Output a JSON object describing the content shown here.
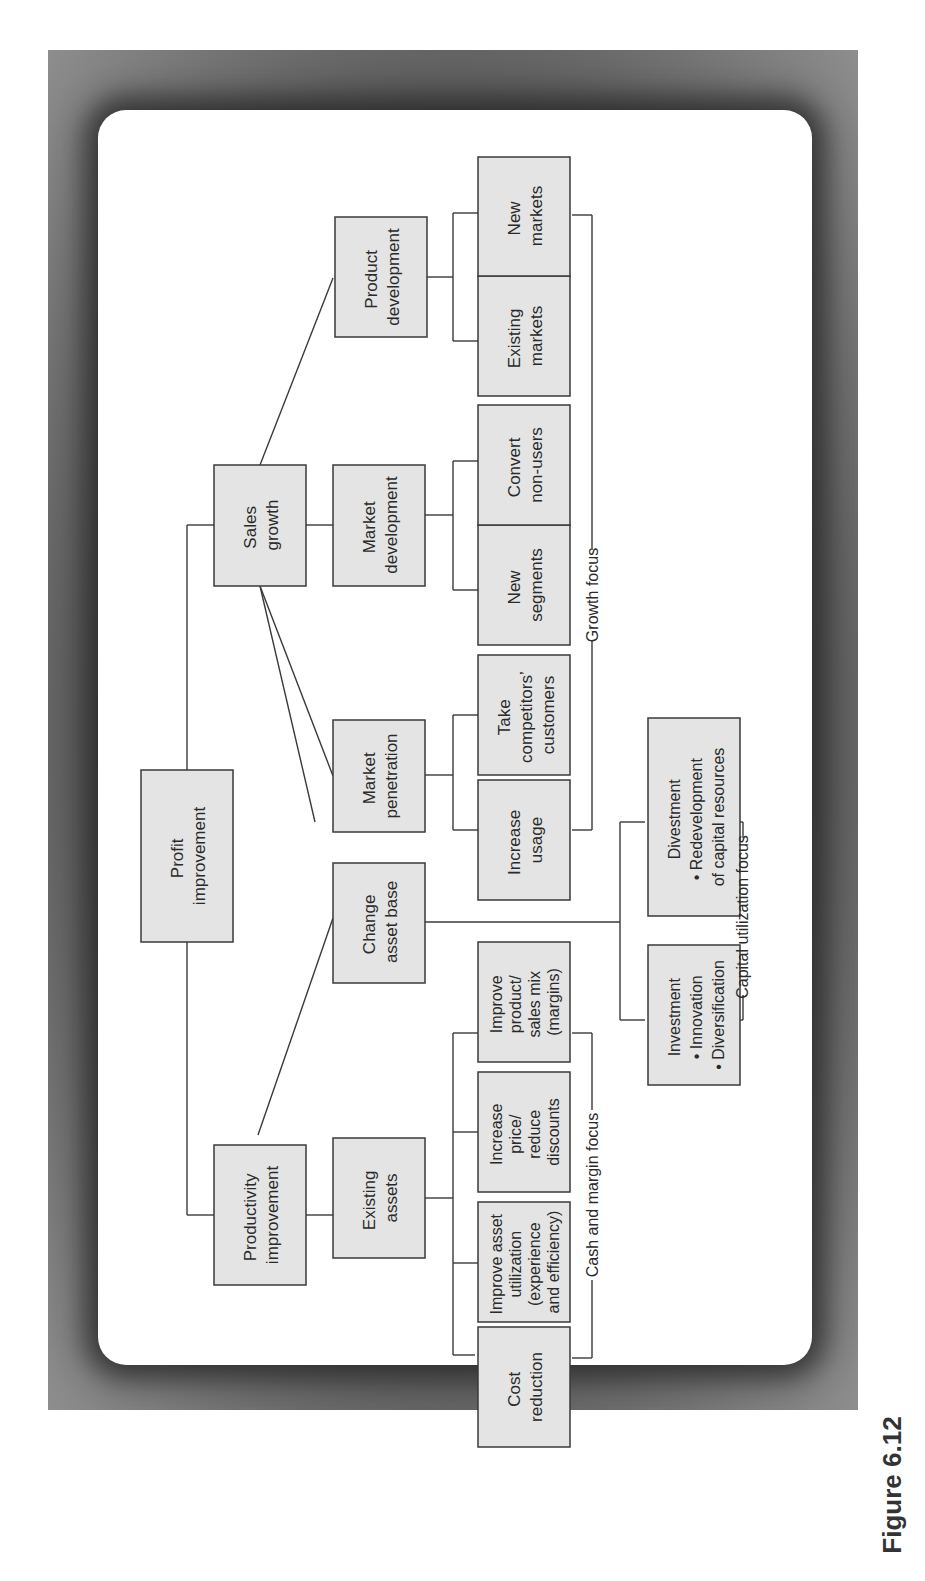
{
  "figure": {
    "caption": "Figure 6.12",
    "orientation": "rotated-90-ccw"
  },
  "colors": {
    "box_fill": "#e4e4e4",
    "box_stroke": "#3a3a3a",
    "frame": "#8a8a8a",
    "panel": "#ffffff"
  },
  "nodes": {
    "root": [
      "Profit",
      "improvement"
    ],
    "productivity": [
      "Productivity",
      "improvement"
    ],
    "sales_growth": [
      "Sales",
      "growth"
    ],
    "existing_assets": [
      "Existing",
      "assets"
    ],
    "change_asset_base": [
      "Change",
      "asset base"
    ],
    "market_penetration": [
      "Market",
      "penetration"
    ],
    "market_development": [
      "Market",
      "development"
    ],
    "product_development": [
      "Product",
      "development"
    ],
    "cost_reduction": [
      "Cost",
      "reduction"
    ],
    "improve_asset_utilization": [
      "Improve asset",
      "utilization",
      "(experience",
      "and efficiency)"
    ],
    "increase_price": [
      "Increase",
      "price/",
      "reduce",
      "discounts"
    ],
    "improve_product_mix": [
      "Improve",
      "product/",
      "sales mix",
      "(margins)"
    ],
    "investment": [
      "Investment",
      "• Innovation",
      "• Diversification"
    ],
    "divestment": [
      "Divestment",
      "• Redevelopment",
      "of capital resources"
    ],
    "increase_usage": [
      "Increase",
      "usage"
    ],
    "take_competitors": [
      "Take",
      "competitors’",
      "customers"
    ],
    "new_segments": [
      "New",
      "segments"
    ],
    "convert_non_users": [
      "Convert",
      "non-users"
    ],
    "existing_markets": [
      "Existing",
      "markets"
    ],
    "new_markets": [
      "New",
      "markets"
    ]
  },
  "focus_labels": {
    "cash_margin": "Cash and margin focus",
    "capital_utilization": "Capital utilization focus",
    "growth": "Growth focus"
  }
}
